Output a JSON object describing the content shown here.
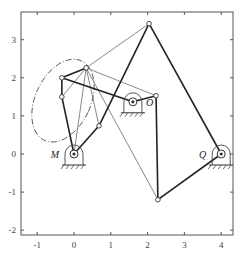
{
  "chart_data": {
    "type": "mechanism-diagram",
    "title": "",
    "xlabel": "",
    "ylabel": "",
    "xlim": [
      -1.45,
      4.3
    ],
    "ylim": [
      -2.1,
      3.75
    ],
    "x_ticks": [
      -1,
      0,
      1,
      2,
      3,
      4
    ],
    "y_ticks": [
      -2,
      -1,
      0,
      1,
      2,
      3
    ],
    "grid": false,
    "pivots": [
      {
        "label": "M",
        "x": 0.0,
        "y": 0.0
      },
      {
        "label": "O",
        "x": 1.6,
        "y": 1.37
      },
      {
        "label": "Q",
        "x": 4.0,
        "y": 0.0
      }
    ],
    "joints": {
      "A": [
        -0.33,
        2.0
      ],
      "B": [
        0.33,
        2.26
      ],
      "C": [
        -0.33,
        1.5
      ],
      "D": [
        2.23,
        1.53
      ],
      "E": [
        0.68,
        0.74
      ],
      "T": [
        2.04,
        3.42
      ],
      "F": [
        2.28,
        -1.2
      ]
    },
    "thick_links": [
      [
        "A",
        "B"
      ],
      [
        "A",
        "C"
      ],
      [
        "C",
        "M"
      ],
      [
        "M",
        "E"
      ],
      [
        "E",
        "T"
      ],
      [
        "A",
        "O"
      ],
      [
        "O",
        "D"
      ],
      [
        "D",
        "F"
      ],
      [
        "F",
        "Q"
      ],
      [
        "T",
        "Q"
      ]
    ],
    "thin_links": [
      [
        "B",
        "C"
      ],
      [
        "B",
        "T"
      ],
      [
        "B",
        "D"
      ],
      [
        "B",
        "E"
      ],
      [
        "B",
        "F"
      ],
      [
        "B",
        "M"
      ]
    ],
    "coupler_curve": {
      "style": "dash-dot",
      "center": [
        -0.3,
        1.4
      ],
      "rx": 0.75,
      "ry": 1.15,
      "rotation_deg": 25
    }
  },
  "labels": {
    "M": "M",
    "O": "O",
    "Q": "Q"
  },
  "ticks": {
    "x": [
      "-1",
      "0",
      "1",
      "2",
      "3",
      "4"
    ],
    "y": [
      "-2",
      "-1",
      "0",
      "1",
      "2",
      "3"
    ]
  }
}
